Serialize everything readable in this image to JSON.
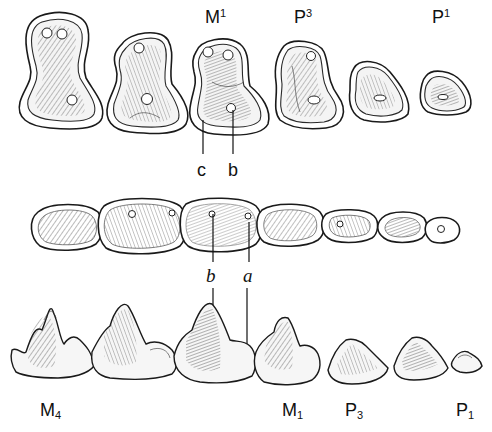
{
  "figure": {
    "type": "dental-illustration",
    "upper_row": {
      "description": "upper teeth, occlusal view",
      "labels": [
        {
          "base": "M",
          "index": "1",
          "position": "superscript"
        },
        {
          "base": "P",
          "index": "3",
          "position": "superscript"
        },
        {
          "base": "P",
          "index": "1",
          "position": "superscript"
        }
      ],
      "pointer_labels": [
        "c",
        "b"
      ],
      "tooth_count": 6
    },
    "lower_occlusal_row": {
      "description": "lower teeth, occlusal view",
      "tooth_count": 7
    },
    "lower_lateral_row": {
      "description": "lower teeth, lateral view",
      "pointer_labels": [
        "b",
        "a"
      ],
      "labels": [
        {
          "base": "M",
          "index": "4",
          "position": "subscript"
        },
        {
          "base": "M",
          "index": "1",
          "position": "subscript"
        },
        {
          "base": "P",
          "index": "3",
          "position": "subscript"
        },
        {
          "base": "P",
          "index": "1",
          "position": "subscript"
        }
      ],
      "tooth_count": 7
    }
  }
}
